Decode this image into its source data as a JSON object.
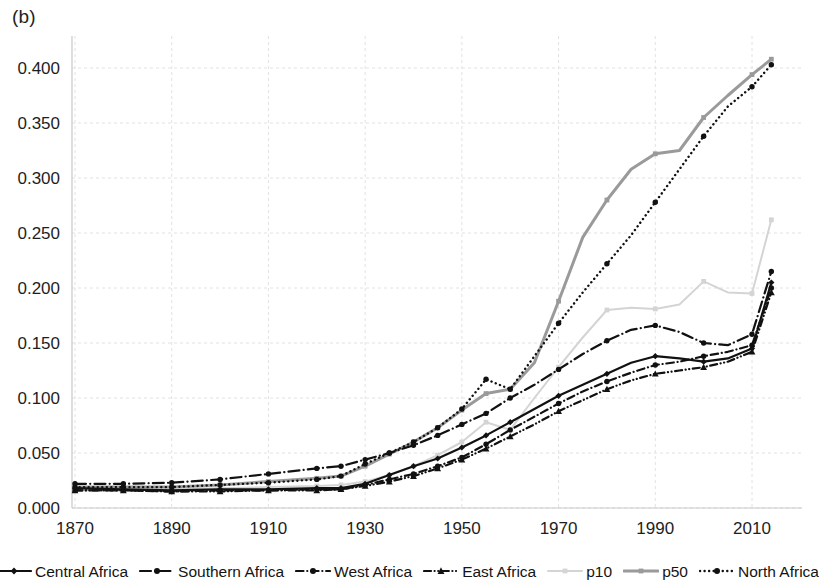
{
  "figure": {
    "panel_label": "(b)",
    "background": "#ffffff"
  },
  "chart_data": {
    "type": "line",
    "title": "",
    "xlabel": "",
    "ylabel": "",
    "xlim": [
      1865,
      2016
    ],
    "ylim": [
      0.0,
      0.425
    ],
    "grid": true,
    "legend_position": "bottom",
    "x_ticks": [
      1870,
      1890,
      1910,
      1930,
      1950,
      1970,
      1990,
      2010
    ],
    "y_ticks": [
      0.0,
      0.05,
      0.1,
      0.15,
      0.2,
      0.25,
      0.3,
      0.35,
      0.4
    ],
    "y_tick_labels": [
      "0.000",
      "0.050",
      "0.100",
      "0.150",
      "0.200",
      "0.250",
      "0.300",
      "0.350",
      "0.400"
    ],
    "x_tick_labels": [
      "1870",
      "1890",
      "1910",
      "1930",
      "1950",
      "1970",
      "1990",
      "2010"
    ],
    "series": [
      {
        "name": "Central Africa",
        "color": "#111111",
        "dash": "solid",
        "width": 2.2,
        "marker": "diamond",
        "x": [
          1870,
          1880,
          1890,
          1900,
          1910,
          1920,
          1925,
          1930,
          1935,
          1940,
          1945,
          1950,
          1955,
          1960,
          1965,
          1970,
          1975,
          1980,
          1985,
          1990,
          1995,
          2000,
          2005,
          2010,
          2014
        ],
        "values": [
          0.018,
          0.017,
          0.016,
          0.017,
          0.017,
          0.018,
          0.018,
          0.022,
          0.03,
          0.038,
          0.045,
          0.055,
          0.066,
          0.078,
          0.09,
          0.102,
          0.112,
          0.122,
          0.132,
          0.138,
          0.136,
          0.133,
          0.136,
          0.145,
          0.205
        ]
      },
      {
        "name": "Southern Africa",
        "color": "#111111",
        "dash": "dashdot-long",
        "width": 2.2,
        "marker": "circle",
        "x": [
          1870,
          1880,
          1890,
          1900,
          1910,
          1920,
          1925,
          1930,
          1935,
          1940,
          1945,
          1950,
          1955,
          1960,
          1965,
          1970,
          1975,
          1980,
          1985,
          1990,
          1995,
          2000,
          2005,
          2010,
          2014
        ],
        "values": [
          0.022,
          0.022,
          0.023,
          0.026,
          0.031,
          0.036,
          0.038,
          0.044,
          0.05,
          0.057,
          0.066,
          0.076,
          0.086,
          0.1,
          0.112,
          0.126,
          0.14,
          0.152,
          0.162,
          0.166,
          0.16,
          0.15,
          0.148,
          0.158,
          0.215
        ]
      },
      {
        "name": "West Africa",
        "color": "#111111",
        "dash": "dashdot-short",
        "width": 2.2,
        "marker": "circle",
        "x": [
          1870,
          1880,
          1890,
          1900,
          1910,
          1920,
          1925,
          1930,
          1935,
          1940,
          1945,
          1950,
          1955,
          1960,
          1965,
          1970,
          1975,
          1980,
          1985,
          1990,
          1995,
          2000,
          2005,
          2010,
          2014
        ],
        "values": [
          0.016,
          0.016,
          0.015,
          0.016,
          0.016,
          0.017,
          0.017,
          0.021,
          0.026,
          0.031,
          0.038,
          0.046,
          0.058,
          0.071,
          0.083,
          0.095,
          0.106,
          0.115,
          0.123,
          0.13,
          0.133,
          0.138,
          0.142,
          0.148,
          0.2
        ]
      },
      {
        "name": "East Africa",
        "color": "#111111",
        "dash": "dash-dot-dot",
        "width": 2.2,
        "marker": "triangle",
        "x": [
          1870,
          1880,
          1890,
          1900,
          1910,
          1920,
          1925,
          1930,
          1935,
          1940,
          1945,
          1950,
          1955,
          1960,
          1965,
          1970,
          1975,
          1980,
          1985,
          1990,
          1995,
          2000,
          2005,
          2010,
          2014
        ],
        "values": [
          0.016,
          0.016,
          0.015,
          0.015,
          0.016,
          0.016,
          0.017,
          0.02,
          0.024,
          0.029,
          0.036,
          0.044,
          0.054,
          0.065,
          0.076,
          0.088,
          0.098,
          0.108,
          0.116,
          0.122,
          0.125,
          0.128,
          0.133,
          0.142,
          0.196
        ]
      },
      {
        "name": "p10",
        "color": "#d4d4d4",
        "dash": "solid",
        "width": 2.0,
        "marker": "small-square",
        "x": [
          1870,
          1880,
          1890,
          1900,
          1910,
          1920,
          1925,
          1930,
          1935,
          1940,
          1945,
          1950,
          1955,
          1960,
          1965,
          1970,
          1975,
          1980,
          1985,
          1990,
          1995,
          2000,
          2005,
          2010,
          2014
        ],
        "values": [
          0.017,
          0.017,
          0.017,
          0.018,
          0.019,
          0.02,
          0.021,
          0.024,
          0.03,
          0.038,
          0.048,
          0.06,
          0.078,
          0.071,
          0.1,
          0.128,
          0.155,
          0.18,
          0.182,
          0.181,
          0.185,
          0.206,
          0.196,
          0.195,
          0.262
        ]
      },
      {
        "name": "p50",
        "color": "#9a9a9a",
        "dash": "solid",
        "width": 3.0,
        "marker": "small-square",
        "x": [
          1870,
          1880,
          1890,
          1900,
          1910,
          1920,
          1925,
          1930,
          1935,
          1940,
          1945,
          1950,
          1955,
          1960,
          1965,
          1970,
          1975,
          1980,
          1985,
          1990,
          1995,
          2000,
          2005,
          2010,
          2014
        ],
        "values": [
          0.019,
          0.019,
          0.019,
          0.021,
          0.024,
          0.027,
          0.029,
          0.038,
          0.049,
          0.06,
          0.073,
          0.089,
          0.104,
          0.108,
          0.132,
          0.188,
          0.246,
          0.28,
          0.308,
          0.322,
          0.325,
          0.355,
          0.375,
          0.394,
          0.408
        ]
      },
      {
        "name": "North Africa",
        "color": "#111111",
        "dash": "dotted",
        "width": 2.4,
        "marker": "circle",
        "x": [
          1870,
          1880,
          1890,
          1900,
          1910,
          1920,
          1925,
          1930,
          1935,
          1940,
          1945,
          1950,
          1955,
          1960,
          1965,
          1970,
          1975,
          1980,
          1985,
          1990,
          1995,
          2000,
          2005,
          2010,
          2014
        ],
        "values": [
          0.019,
          0.019,
          0.019,
          0.021,
          0.023,
          0.026,
          0.029,
          0.04,
          0.05,
          0.06,
          0.073,
          0.09,
          0.117,
          0.108,
          0.138,
          0.168,
          0.196,
          0.222,
          0.248,
          0.278,
          0.308,
          0.338,
          0.365,
          0.383,
          0.403
        ]
      }
    ]
  },
  "legend": {
    "items": [
      {
        "label": "Central Africa",
        "swatch": "legend-swatch-central-africa"
      },
      {
        "label": "Southern Africa",
        "swatch": "legend-swatch-southern-africa"
      },
      {
        "label": "West Africa",
        "swatch": "legend-swatch-west-africa"
      },
      {
        "label": "East Africa",
        "swatch": "legend-swatch-east-africa"
      },
      {
        "label": "p10",
        "swatch": "legend-swatch-p10"
      },
      {
        "label": "p50",
        "swatch": "legend-swatch-p50"
      },
      {
        "label": "North Africa",
        "swatch": "legend-swatch-north-africa"
      }
    ]
  }
}
